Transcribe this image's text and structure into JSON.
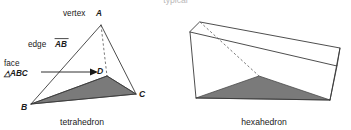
{
  "figure": {
    "clipped_top_line": "typical",
    "background_color": "#ffffff",
    "shade_color": "#7a7a7a",
    "edge_color": "#3a3a3a",
    "hidden_edge_color": "#6a6a6a"
  },
  "tetrahedron": {
    "caption": "tetrahedron",
    "annotations": {
      "vertex_label": "vertex",
      "vertex_letter": "A",
      "edge_label": "edge",
      "edge_letters": "AB",
      "face_label": "face",
      "face_letters": "△ABC"
    },
    "vertices": [
      {
        "name": "A",
        "letter": "A",
        "x": 101,
        "y": 25
      },
      {
        "name": "B",
        "letter": "B",
        "x": 31,
        "y": 104
      },
      {
        "name": "C",
        "letter": "C",
        "x": 136,
        "y": 94
      },
      {
        "name": "D",
        "letter": "D",
        "x": 107,
        "y": 76
      }
    ]
  },
  "hexahedron": {
    "caption": "hexahedron",
    "vertices": [
      {
        "name": "top-back-left",
        "x": 200,
        "y": 22
      },
      {
        "name": "top-back-right",
        "x": 340,
        "y": 48
      },
      {
        "name": "top-front-right",
        "x": 337,
        "y": 66
      },
      {
        "name": "top-front-left",
        "x": 190,
        "y": 32
      },
      {
        "name": "bottom-front-left",
        "x": 196,
        "y": 98
      },
      {
        "name": "bottom-front-right",
        "x": 330,
        "y": 100
      },
      {
        "name": "bottom-back-center",
        "x": 259,
        "y": 76
      }
    ]
  }
}
